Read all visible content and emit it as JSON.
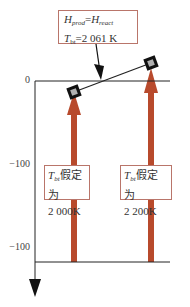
{
  "callout": {
    "line1": {
      "H": "H",
      "sub1": "prod",
      "eq": "=",
      "H2": "H",
      "sub2": "react"
    },
    "line2": {
      "T": "T",
      "sub": "bt",
      "value": "=2 061 K"
    }
  },
  "axis": {
    "ticks": [
      {
        "label": "0",
        "y": 81
      },
      {
        "label": "−100",
        "y": 164
      },
      {
        "label": "−100",
        "y": 248
      }
    ]
  },
  "boxes": [
    {
      "T": "T",
      "sub": "bt",
      "text": "假定为",
      "value": "2 000K"
    },
    {
      "T": "T",
      "sub": "bt",
      "text": "假定为",
      "value": "2 200K"
    }
  ],
  "colors": {
    "arrow": "#b84a2c",
    "box_border": "#b9756a",
    "axis": "#222222",
    "marker_fill": "#b0b0b0"
  }
}
